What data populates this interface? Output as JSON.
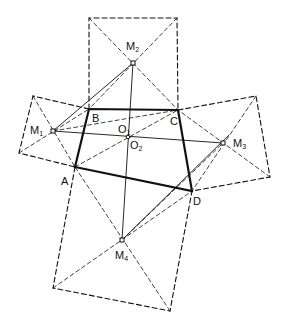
{
  "diagram": {
    "type": "geometry-construction",
    "points": {
      "A": [
        75,
        167
      ],
      "B": [
        89,
        109
      ],
      "C": [
        178,
        110
      ],
      "D": [
        192,
        191
      ],
      "M1": [
        53,
        131
      ],
      "M2": [
        133,
        63
      ],
      "M3": [
        223,
        143
      ],
      "M4": [
        122,
        240
      ],
      "O": [
        128,
        137
      ]
    },
    "square_corners": {
      "top": [
        [
          89,
          18
        ],
        [
          177,
          18
        ]
      ],
      "left": [
        [
          33,
          96
        ],
        [
          19,
          153
        ]
      ],
      "right": [
        [
          256,
          96
        ],
        [
          270,
          177
        ]
      ],
      "bottom": [
        [
          53,
          288
        ],
        [
          170,
          311
        ]
      ]
    },
    "labels": [
      {
        "id": "M2",
        "text": "M",
        "sub": "2",
        "x": 126,
        "y": 41
      },
      {
        "id": "M1",
        "text": "M",
        "sub": "1",
        "x": 30,
        "y": 125
      },
      {
        "id": "M3",
        "text": "M",
        "sub": "3",
        "x": 233,
        "y": 138
      },
      {
        "id": "M4",
        "text": "M",
        "sub": "4",
        "x": 115,
        "y": 250
      },
      {
        "id": "B",
        "text": "B",
        "sub": "",
        "x": 92,
        "y": 113
      },
      {
        "id": "C",
        "text": "C",
        "sub": "",
        "x": 170,
        "y": 116
      },
      {
        "id": "A",
        "text": "A",
        "sub": "",
        "x": 61,
        "y": 176
      },
      {
        "id": "D",
        "text": "D",
        "sub": "",
        "x": 193,
        "y": 196
      },
      {
        "id": "O1",
        "text": "O",
        "sub": "1",
        "x": 118,
        "y": 124
      },
      {
        "id": "O2",
        "text": "O",
        "sub": "2",
        "x": 130,
        "y": 140
      }
    ],
    "colors": {
      "stroke": "#111111",
      "background": "#ffffff"
    }
  }
}
